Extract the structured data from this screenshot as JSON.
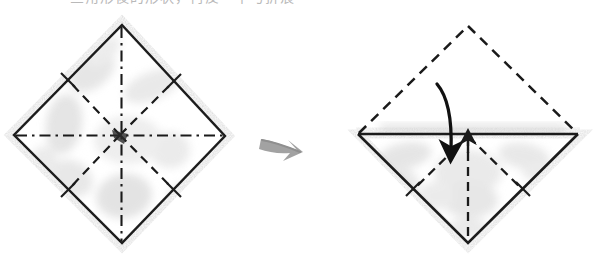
{
  "page": {
    "width": 598,
    "height": 260,
    "background_color": "#ffffff",
    "media": "scanned book page"
  },
  "caption": {
    "text": "三角形後的形状，再反一半与折痕",
    "note": "cut off at top edge of image; only bottom strokes visible",
    "color": "#b9b9b9"
  },
  "colors": {
    "paper_white": "#ffffff",
    "ink_solid": "#1a1a1a",
    "ink_dashed": "#1a1a1a",
    "paper_shadow": "#d8d8d8",
    "paper_blotch": "#e4e4e4",
    "transition_arrow": "#9a9a9a",
    "fold_arrow": "#111111"
  },
  "steps": [
    {
      "id": "step-left",
      "name": "square-with-creases",
      "description": "Square rotated 45 degrees showing eight radial crease lines",
      "center": {
        "x": 120,
        "y": 135
      },
      "vertices": {
        "top": {
          "x": 122,
          "y": 25
        },
        "right": {
          "x": 225,
          "y": 136
        },
        "bottom": {
          "x": 122,
          "y": 243
        },
        "left": {
          "x": 14,
          "y": 135
        }
      },
      "outline_style": "solid",
      "creases": [
        {
          "name": "horizontal-crease",
          "style": "dash-dot",
          "from": "left-vertex",
          "to": "right-vertex"
        },
        {
          "name": "vertical-crease",
          "style": "dash-dot",
          "from": "top-vertex",
          "to": "bottom-vertex"
        },
        {
          "name": "diagonal-crease-upper-left",
          "style": "dashed",
          "from": "center",
          "to": "upper-left-edge-midpoint"
        },
        {
          "name": "diagonal-crease-upper-right",
          "style": "dashed",
          "from": "center",
          "to": "upper-right-edge-midpoint"
        },
        {
          "name": "diagonal-crease-lower-right",
          "style": "dashed",
          "from": "center",
          "to": "lower-right-edge-midpoint"
        },
        {
          "name": "diagonal-crease-lower-left",
          "style": "dashed",
          "from": "center",
          "to": "lower-left-edge-midpoint"
        }
      ],
      "edge_tick_marks": 4
    },
    {
      "id": "step-right",
      "name": "top-half-folded-down",
      "description": "Upper half shown as dashed ghost outline, folded down onto the solid lower half",
      "center": {
        "x": 468,
        "y": 134
      },
      "vertices": {
        "top": {
          "x": 468,
          "y": 26
        },
        "right": {
          "x": 578,
          "y": 134
        },
        "bottom": {
          "x": 468,
          "y": 243
        },
        "left": {
          "x": 358,
          "y": 134
        }
      },
      "upper_outline_style": "dashed",
      "lower_outline_style": "solid",
      "fold_line": {
        "name": "horizontal-fold-line",
        "style": "solid",
        "from": {
          "x": 358,
          "y": 134
        },
        "to": {
          "x": 578,
          "y": 134
        }
      },
      "creases": [
        {
          "name": "vertical-crease",
          "style": "dashed",
          "from": "center",
          "to": "bottom-vertex"
        },
        {
          "name": "diagonal-crease-lower-left",
          "style": "dashed",
          "from": "center",
          "to": "lower-left-edge-midpoint"
        },
        {
          "name": "diagonal-crease-lower-right",
          "style": "dashed",
          "from": "center",
          "to": "lower-right-edge-midpoint"
        }
      ],
      "edge_tick_marks": 2
    }
  ],
  "annotations": {
    "transition_arrow": {
      "name": "step-transition-arrow",
      "direction": "right",
      "from": {
        "x": 262,
        "y": 140
      },
      "to": {
        "x": 303,
        "y": 155
      },
      "style": "hand-drawn gray"
    },
    "fold_arrow": {
      "name": "fold-down-arrow",
      "direction": "curved down-right",
      "start": {
        "x": 438,
        "y": 84
      },
      "end": {
        "x": 456,
        "y": 164
      },
      "style": "bold curved black"
    },
    "pointer_arrow": {
      "name": "fold-line-pointer-arrow",
      "direction": "up",
      "start": {
        "x": 468,
        "y": 152
      },
      "end": {
        "x": 468,
        "y": 133
      },
      "style": "short straight black"
    }
  }
}
